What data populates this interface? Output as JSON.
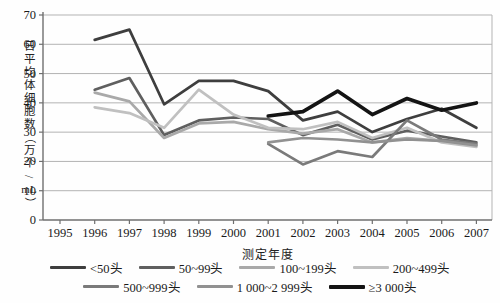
{
  "chart_data": {
    "type": "line",
    "title": "",
    "xlabel": "测定年度",
    "ylabel": "日平均体细胞数（万个/mL）",
    "ylabel_chars": [
      "日",
      "平",
      "均",
      "体",
      "细",
      "胞",
      "数",
      "（",
      "万",
      "个",
      "/",
      "mL",
      "）"
    ],
    "categories": [
      "1995",
      "1996",
      "1997",
      "1998",
      "1999",
      "2000",
      "2001",
      "2002",
      "2003",
      "2004",
      "2005",
      "2006",
      "2007"
    ],
    "ylim": [
      0,
      70
    ],
    "yticks": [
      0,
      10,
      20,
      30,
      40,
      50,
      60,
      70
    ],
    "grid": "horizontal",
    "legend_position": "bottom",
    "legend_rows": [
      [
        0,
        1,
        2,
        3
      ],
      [
        4,
        5,
        6
      ]
    ],
    "series": [
      {
        "name": "<50头",
        "color": "#3e3e3e",
        "width": 2.7,
        "values": [
          null,
          61.5,
          65,
          39.5,
          47.5,
          47.5,
          44,
          34,
          37,
          30,
          34.5,
          38,
          31.5
        ]
      },
      {
        "name": "50~99头",
        "color": "#5f5f5f",
        "width": 2.7,
        "values": [
          null,
          44.5,
          48.5,
          29,
          34,
          35,
          34.5,
          29,
          32.5,
          27.5,
          30.5,
          28.5,
          26.5
        ]
      },
      {
        "name": "100~199头",
        "color": "#a9a9a9",
        "width": 2.7,
        "values": [
          null,
          43.5,
          40.5,
          28,
          33,
          33.5,
          31,
          29.5,
          31,
          26.5,
          28,
          27,
          25.5
        ]
      },
      {
        "name": "200~499头",
        "color": "#c0c0c0",
        "width": 2.7,
        "values": [
          null,
          38.5,
          36.5,
          31.5,
          44.5,
          36,
          31.5,
          31,
          33.5,
          28,
          31.5,
          26.5,
          25
        ]
      },
      {
        "name": "500~999头",
        "color": "#7a7a7a",
        "width": 2.7,
        "values": [
          null,
          null,
          null,
          null,
          null,
          null,
          26,
          19,
          23.5,
          21.5,
          34,
          27.5,
          26
        ]
      },
      {
        "name": "1 000~2 999头",
        "color": "#919191",
        "width": 2.7,
        "values": [
          null,
          null,
          null,
          null,
          null,
          null,
          26.5,
          28,
          27.5,
          26.5,
          27.5,
          27,
          25.5
        ]
      },
      {
        "name": "≥3 000头",
        "color": "#141414",
        "width": 3.6,
        "values": [
          null,
          null,
          null,
          null,
          null,
          null,
          35.5,
          37,
          44,
          36,
          41.5,
          37.5,
          40
        ]
      }
    ],
    "axis_colors": {
      "axis": "#6f6f6f",
      "grid": "#b3b3b3",
      "tick_label": "#1a1a1a"
    }
  }
}
